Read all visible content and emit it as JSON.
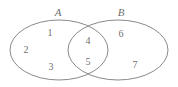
{
  "figure": {
    "kind": "venn-diagram",
    "background_color": "#ffffff",
    "stroke_color": "#8a8a8a",
    "text_color": "#6f6f6f",
    "width": 178,
    "height": 87
  },
  "sets": [
    {
      "name": "set-a",
      "label": "A",
      "label_x": 58,
      "label_y": 12,
      "cx": 59,
      "cy": 50,
      "rx": 49,
      "ry": 30
    },
    {
      "name": "set-b",
      "label": "B",
      "label_x": 121,
      "label_y": 12,
      "cx": 118,
      "cy": 50,
      "rx": 50,
      "ry": 30
    }
  ],
  "regions": [
    {
      "name": "a-only-1",
      "label": "1",
      "x": 50,
      "y": 33,
      "region": "A only"
    },
    {
      "name": "a-only-2",
      "label": "2",
      "x": 26,
      "y": 50,
      "region": "A only"
    },
    {
      "name": "a-only-3",
      "label": "3",
      "x": 51,
      "y": 67,
      "region": "A only"
    },
    {
      "name": "intersection-4",
      "label": "4",
      "x": 88,
      "y": 41,
      "region": "A and B"
    },
    {
      "name": "intersection-5",
      "label": "5",
      "x": 88,
      "y": 62,
      "region": "A and B"
    },
    {
      "name": "b-only-6",
      "label": "6",
      "x": 121,
      "y": 34,
      "region": "B only"
    },
    {
      "name": "b-only-7",
      "label": "7",
      "x": 135,
      "y": 65,
      "region": "B only"
    }
  ]
}
